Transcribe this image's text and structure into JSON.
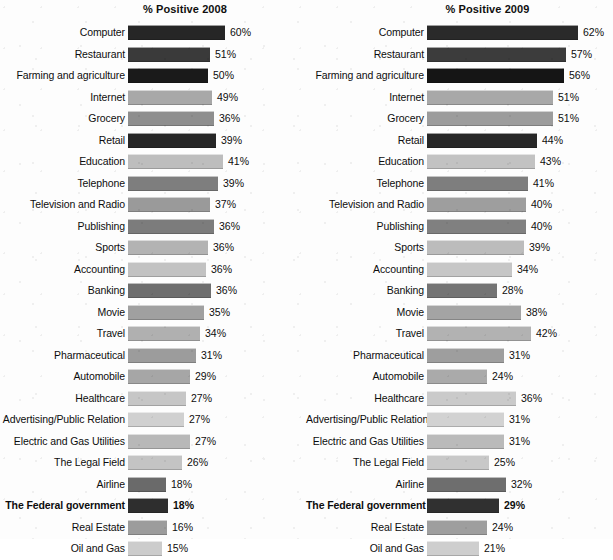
{
  "chart_data": [
    {
      "type": "bar",
      "orientation": "horizontal",
      "title": "% Positive 2008",
      "xlabel": "",
      "ylabel": "",
      "unit": "%",
      "xlim": [
        0,
        62
      ],
      "grid": false,
      "legend": "none",
      "categories": [
        "Computer",
        "Restaurant",
        "Farming and agriculture",
        "Internet",
        "Grocery",
        "Retail",
        "Education",
        "Telephone",
        "Television and Radio",
        "Publishing",
        "Sports",
        "Accounting",
        "Banking",
        "Movie",
        "Travel",
        "Pharmaceutical",
        "Automobile",
        "Healthcare",
        "Advertising/Public Relation",
        "Electric and Gas Utilities",
        "The Legal Field",
        "Airline",
        "The Federal government",
        "Real Estate",
        "Oil and Gas"
      ],
      "values": [
        60,
        51,
        50,
        49,
        36,
        39,
        41,
        39,
        37,
        36,
        36,
        36,
        36,
        35,
        34,
        31,
        29,
        27,
        27,
        27,
        26,
        18,
        18,
        16,
        15
      ],
      "value_labels": [
        "60%",
        "51%",
        "50%",
        "49%",
        "36%",
        "39%",
        "41%",
        "39%",
        "37%",
        "36%",
        "36%",
        "36%",
        "36%",
        "35%",
        "34%",
        "31%",
        "29%",
        "27%",
        "27%",
        "27%",
        "26%",
        "18%",
        "18%",
        "16%",
        "15%"
      ],
      "bar_pixel_widths": [
        97,
        82,
        80,
        84,
        86,
        88,
        95,
        90,
        82,
        86,
        80,
        78,
        83,
        76,
        72,
        68,
        62,
        58,
        56,
        62,
        54,
        38,
        40,
        39,
        34
      ],
      "bar_shades": [
        "#262626",
        "#3a3a3a",
        "#1a1a1a",
        "#a8a8a8",
        "#8e8e8e",
        "#262626",
        "#bdbdbd",
        "#7e7e7e",
        "#9a9a9a",
        "#7c7c7c",
        "#b3b3b3",
        "#c2c2c2",
        "#6e6e6e",
        "#a0a0a0",
        "#b0b0b0",
        "#9c9c9c",
        "#a6a6a6",
        "#c6c6c6",
        "#d0d0d0",
        "#b8b8b8",
        "#c4c4c4",
        "#6a6a6a",
        "#2e2e2e",
        "#9c9c9c",
        "#cccccc"
      ],
      "highlighted_category": "The Federal government"
    },
    {
      "type": "bar",
      "orientation": "horizontal",
      "title": "% Positive 2009",
      "xlabel": "",
      "ylabel": "",
      "unit": "%",
      "xlim": [
        0,
        62
      ],
      "grid": false,
      "legend": "none",
      "categories": [
        "Computer",
        "Restaurant",
        "Farming and agriculture",
        "Internet",
        "Grocery",
        "Retail",
        "Education",
        "Telephone",
        "Television and Radio",
        "Publishing",
        "Sports",
        "Accounting",
        "Banking",
        "Movie",
        "Travel",
        "Pharmaceutical",
        "Automobile",
        "Healthcare",
        "Advertising/Public Relation",
        "Electric and Gas Utilities",
        "The Legal Field",
        "Airline",
        "The Federal government",
        "Real Estate",
        "Oil and Gas"
      ],
      "values": [
        62,
        57,
        56,
        51,
        51,
        44,
        43,
        41,
        40,
        40,
        39,
        34,
        28,
        38,
        42,
        31,
        24,
        36,
        31,
        31,
        25,
        32,
        29,
        24,
        21
      ],
      "value_labels": [
        "62%",
        "57%",
        "56%",
        "51%",
        "51%",
        "44%",
        "43%",
        "41%",
        "40%",
        "40%",
        "39%",
        "34%",
        "28%",
        "38%",
        "42%",
        "31%",
        "24%",
        "36%",
        "31%",
        "31%",
        "25%",
        "32%",
        "29%",
        "24%",
        "21%"
      ],
      "bar_pixel_widths": [
        151,
        139,
        137,
        126,
        126,
        110,
        108,
        101,
        99,
        99,
        97,
        85,
        70,
        94,
        104,
        77,
        60,
        89,
        77,
        77,
        62,
        79,
        72,
        60,
        52
      ],
      "bar_shades": [
        "#2a2a2a",
        "#3c3c3c",
        "#151515",
        "#a8a8a8",
        "#9c9c9c",
        "#272727",
        "#c2c2c2",
        "#7e7e7e",
        "#9e9e9e",
        "#808080",
        "#bcbcbc",
        "#c6c6c6",
        "#747474",
        "#a4a4a4",
        "#b2b2b2",
        "#9e9e9e",
        "#aaaaaa",
        "#cacaca",
        "#d2d2d2",
        "#bababa",
        "#c8c8c8",
        "#6e6e6e",
        "#303030",
        "#9e9e9e",
        "#cecece"
      ],
      "highlighted_category": "The Federal government"
    }
  ]
}
